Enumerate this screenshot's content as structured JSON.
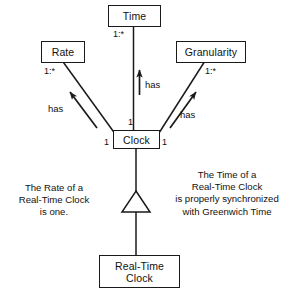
{
  "diagram": {
    "stroke_color": "#1a1a1a",
    "text_color": "#111111",
    "background": "#ffffff"
  },
  "classes": {
    "time": {
      "name": "Time"
    },
    "rate": {
      "name": "Rate"
    },
    "granularity": {
      "name": "Granularity"
    },
    "clock": {
      "name": "Clock"
    },
    "real_time_clock": {
      "name": "Real-Time\nClock"
    }
  },
  "associations": [
    {
      "id": "clock-time",
      "label": "has",
      "source_multiplicity": "1",
      "target_multiplicity": "1:*"
    },
    {
      "id": "clock-rate",
      "label": "has",
      "source_multiplicity": "1",
      "target_multiplicity": "1:*"
    },
    {
      "id": "clock-granularity",
      "label": "has",
      "source_multiplicity": "1",
      "target_multiplicity": "1:*"
    }
  ],
  "generalization": {
    "id": "rtc-clock",
    "child": "Real-Time Clock",
    "parent": "Clock"
  },
  "multiplicities": {
    "time_end": "1:*",
    "rate_end": "1:*",
    "granularity_end": "1:*",
    "clock_top": "1",
    "clock_left": "1",
    "clock_right": "1"
  },
  "role_labels": {
    "time": "has",
    "rate": "has",
    "granularity": "has"
  },
  "notes": {
    "left": "The Rate of a\nReal-Time Clock\nis one.",
    "right": "The Time of a\nReal-Time Clock\nis properly synchronized\nwith Greenwich Time"
  }
}
